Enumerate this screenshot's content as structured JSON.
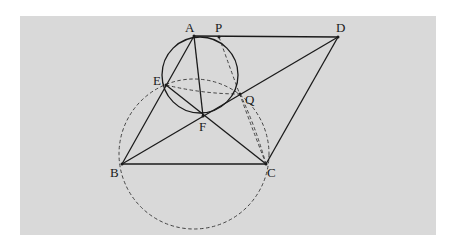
{
  "diagram": {
    "type": "geometry",
    "points": {
      "A": {
        "label": "A"
      },
      "P": {
        "label": "P"
      },
      "D": {
        "label": "D"
      },
      "E": {
        "label": "E"
      },
      "Q": {
        "label": "Q"
      },
      "F": {
        "label": "F"
      },
      "B": {
        "label": "B"
      },
      "C": {
        "label": "C"
      }
    },
    "solid_segments": [
      [
        "A",
        "D"
      ],
      [
        "A",
        "B"
      ],
      [
        "B",
        "C"
      ],
      [
        "C",
        "D"
      ],
      [
        "B",
        "D"
      ],
      [
        "A",
        "F"
      ],
      [
        "E",
        "C"
      ]
    ],
    "solid_circles": [
      {
        "through": [
          "A",
          "E",
          "F",
          "Q",
          "P"
        ]
      }
    ],
    "dashed_circles": [
      {
        "through": [
          "E",
          "B",
          "C",
          "Q"
        ]
      }
    ],
    "dashed_curves": [
      [
        "E",
        "Q"
      ],
      [
        "P",
        "C"
      ],
      [
        "Q",
        "C"
      ]
    ],
    "colors": {
      "background": "#d9d9d9",
      "stroke": "#1a1a1a"
    }
  }
}
